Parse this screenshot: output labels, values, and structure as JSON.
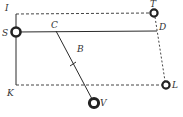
{
  "diagram": {
    "type": "geometric-diagram",
    "colors": {
      "line": "#2a2a2a",
      "dashed": "#444444",
      "point": "#222222",
      "background": "#ffffff"
    },
    "labels": {
      "I": "I",
      "T": "T",
      "S": "S",
      "C": "C",
      "D": "D",
      "B": "B",
      "K": "K",
      "L": "L",
      "V": "V"
    },
    "points": [
      {
        "name": "I",
        "x": 16,
        "y": 14,
        "marker": false
      },
      {
        "name": "T",
        "x": 154,
        "y": 13,
        "marker": true
      },
      {
        "name": "S",
        "x": 15,
        "y": 32,
        "marker": true
      },
      {
        "name": "C",
        "x": 56,
        "y": 31,
        "marker": false
      },
      {
        "name": "D",
        "x": 157,
        "y": 31,
        "marker": false
      },
      {
        "name": "B",
        "x": 73,
        "y": 64,
        "marker": "tick"
      },
      {
        "name": "K",
        "x": 16,
        "y": 85,
        "marker": false
      },
      {
        "name": "L",
        "x": 166,
        "y": 85,
        "marker": true
      },
      {
        "name": "V",
        "x": 94,
        "y": 103,
        "marker": true
      }
    ],
    "segments": [
      {
        "from": "I",
        "to": "T",
        "style": "dashed"
      },
      {
        "from": "S",
        "to": "D",
        "style": "solid"
      },
      {
        "from": "I",
        "to": "K",
        "style": "solid"
      },
      {
        "from": "K",
        "to": "L",
        "style": "dashed"
      },
      {
        "from": "T",
        "to": "L",
        "style": "dashed"
      },
      {
        "from": "C",
        "to": "V",
        "style": "solid"
      }
    ]
  }
}
